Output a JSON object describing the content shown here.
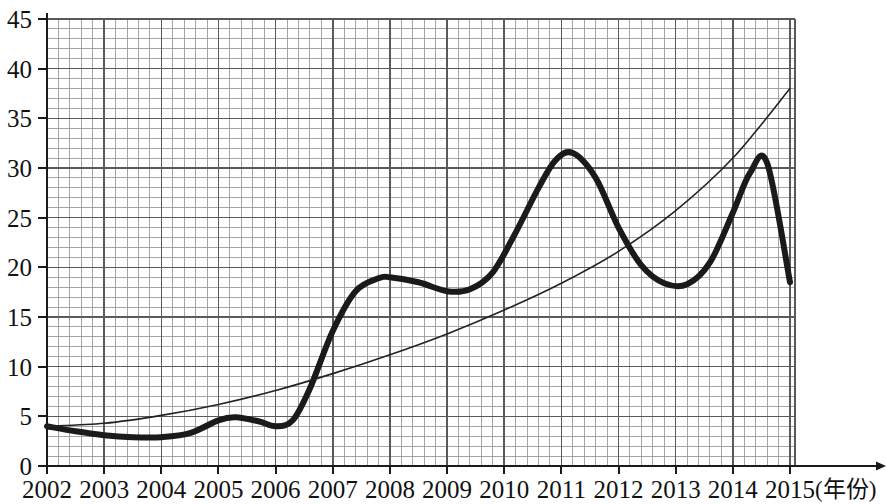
{
  "chart_data": {
    "type": "line",
    "title": "",
    "subtitle": "",
    "xlabel": "年份",
    "xlabel_display": "(年份)",
    "ylabel": "",
    "grid": true,
    "minor_grid": true,
    "legend_position": "none",
    "xlim": [
      2002,
      2015
    ],
    "ylim": [
      0,
      45
    ],
    "x_tick_step": 1,
    "y_tick_step": 5,
    "x_minor_step": 0.2,
    "y_minor_step": 1,
    "x_ticks": [
      "2002",
      "2003",
      "2004",
      "2005",
      "2006",
      "2007",
      "2008",
      "2009",
      "2010",
      "2011",
      "2012",
      "2013",
      "2014",
      "2015"
    ],
    "y_ticks": [
      "0",
      "5",
      "10",
      "15",
      "20",
      "25",
      "30",
      "35",
      "40",
      "45"
    ],
    "x": [
      2002,
      2015
    ],
    "series": [
      {
        "name": "bold-curve",
        "style": "thick",
        "color": "#1a1a1a",
        "width": 6,
        "x": [
          2002,
          2002.5,
          2003,
          2003.5,
          2004,
          2004.5,
          2005,
          2005.3,
          2005.7,
          2006,
          2006.3,
          2006.6,
          2007,
          2007.4,
          2007.8,
          2008,
          2008.5,
          2009,
          2009.4,
          2009.8,
          2010.2,
          2010.6,
          2010.9,
          2011.2,
          2011.6,
          2012,
          2012.4,
          2012.8,
          2013.2,
          2013.6,
          2014,
          2014.3,
          2014.6,
          2015
        ],
        "values": [
          4.0,
          3.5,
          3.1,
          2.9,
          2.9,
          3.3,
          4.6,
          4.9,
          4.5,
          4.0,
          4.6,
          7.8,
          13.6,
          17.6,
          18.9,
          19.0,
          18.5,
          17.6,
          17.8,
          19.5,
          23.5,
          28.0,
          30.8,
          31.5,
          29.0,
          24.0,
          20.2,
          18.4,
          18.3,
          20.5,
          25.5,
          29.5,
          30.5,
          18.5
        ]
      },
      {
        "name": "thin-curve",
        "style": "thin",
        "color": "#222222",
        "width": 1.6,
        "x": [
          2002,
          2003,
          2004,
          2005,
          2006,
          2007,
          2008,
          2009,
          2010,
          2011,
          2012,
          2013,
          2014,
          2015
        ],
        "values": [
          4.0,
          4.3,
          5.1,
          6.2,
          7.6,
          9.3,
          11.2,
          13.3,
          15.7,
          18.4,
          21.6,
          25.7,
          31.0,
          38.0
        ]
      }
    ],
    "annotations": [],
    "notes": {
      "bold_peak_1": {
        "x": 2011.2,
        "y": 31.5
      },
      "bold_peak_2": {
        "x": 2014.6,
        "y": 30.5
      },
      "bold_trough_1": {
        "x": 2003.8,
        "y": 2.9
      },
      "bold_trough_2": {
        "x": 2009.1,
        "y": 17.6
      },
      "bold_trough_3": {
        "x": 2013.0,
        "y": 18.3
      },
      "bold_plateau": {
        "x": 2008.0,
        "y": 19.0
      },
      "bold_end": {
        "x": 2015,
        "y": 18.5
      },
      "thin_end": {
        "x": 2015,
        "y": 38.0
      }
    }
  },
  "colors": {
    "background": "#ffffff",
    "grid_minor": "#9a9a9a",
    "grid_major": "#5a5a5a",
    "axis": "#1a1a1a",
    "text": "#111111",
    "series_bold": "#1a1a1a",
    "series_thin": "#222222"
  }
}
